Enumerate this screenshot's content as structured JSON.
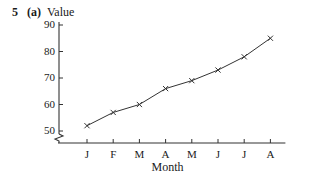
{
  "header": {
    "question_number": "5",
    "part_label": "(a)"
  },
  "chart_data": {
    "type": "line",
    "title": "",
    "xlabel": "Month",
    "ylabel": "Value",
    "categories": [
      "J",
      "F",
      "M",
      "A",
      "M",
      "J",
      "J",
      "A"
    ],
    "values": [
      52,
      57,
      60,
      66,
      69,
      73,
      78,
      85
    ],
    "y_ticks": [
      50,
      60,
      70,
      80,
      90
    ],
    "ylim": [
      50,
      90
    ],
    "y_axis_break": true,
    "marker": "x",
    "grid": false,
    "legend": "none",
    "colors": {
      "line": "#333333",
      "axis": "#333333",
      "text": "#1a1a1a"
    }
  }
}
